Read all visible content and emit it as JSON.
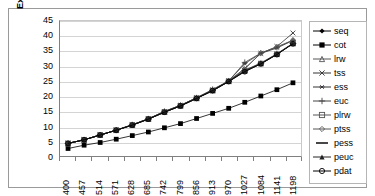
{
  "chart_data": {
    "type": "line",
    "title": "",
    "xlabel": "",
    "ylabel": "Execution Times (secs)",
    "ylim": [
      0,
      45
    ],
    "ytick_step": 5,
    "yticks": [
      45,
      40,
      35,
      30,
      25,
      20,
      15,
      10,
      5,
      0
    ],
    "grid": true,
    "legend_position": "right",
    "categories": [
      400,
      457,
      514,
      571,
      628,
      685,
      742,
      799,
      856,
      913,
      970,
      1027,
      1084,
      1141,
      1198
    ],
    "series": [
      {
        "name": "seq",
        "marker": "filled-diamond",
        "color": "#000000",
        "values": [
          4.2,
          5.4,
          7.0,
          8.6,
          10.3,
          12.3,
          14.6,
          16.7,
          19.2,
          21.7,
          24.8,
          28.2,
          30.7,
          33.9,
          37.5
        ]
      },
      {
        "name": "cot",
        "marker": "filled-square",
        "color": "#000000",
        "values": [
          2.5,
          3.6,
          4.5,
          5.6,
          6.8,
          8.0,
          9.4,
          10.8,
          12.5,
          14.2,
          15.9,
          17.9,
          20.0,
          22.1,
          24.4
        ]
      },
      {
        "name": "lrw",
        "marker": "open-triangle",
        "color": "#555555",
        "values": [
          4.2,
          5.4,
          7.0,
          8.6,
          10.4,
          12.4,
          14.7,
          16.8,
          19.3,
          21.9,
          25.0,
          28.6,
          31.0,
          34.1,
          37.6
        ]
      },
      {
        "name": "tss",
        "marker": "cross-x",
        "color": "#333333",
        "values": [
          4.2,
          5.4,
          7.0,
          8.6,
          10.4,
          12.4,
          14.8,
          16.9,
          19.4,
          22.0,
          25.0,
          29.2,
          34.2,
          36.5,
          41.0
        ]
      },
      {
        "name": "ess",
        "marker": "asterisk",
        "color": "#333333",
        "values": [
          4.2,
          5.4,
          7.0,
          8.6,
          10.4,
          12.4,
          14.8,
          16.9,
          19.4,
          22.0,
          25.0,
          30.8,
          34.2,
          36.0,
          38.5
        ]
      },
      {
        "name": "euc",
        "marker": "plus",
        "color": "#444444",
        "values": [
          4.2,
          5.4,
          7.0,
          8.6,
          10.4,
          12.4,
          14.9,
          16.9,
          19.4,
          22.2,
          25.0,
          31.2,
          34.3,
          36.2,
          38.6
        ]
      },
      {
        "name": "plrw",
        "marker": "open-square",
        "color": "#555555",
        "values": [
          4.2,
          5.4,
          7.0,
          8.6,
          10.3,
          12.3,
          14.6,
          16.7,
          19.2,
          21.8,
          24.9,
          28.4,
          30.8,
          33.9,
          37.5
        ]
      },
      {
        "name": "ptss",
        "marker": "open-diamond",
        "color": "#555555",
        "values": [
          4.2,
          5.4,
          7.0,
          8.6,
          10.4,
          12.4,
          14.7,
          16.8,
          19.3,
          21.9,
          25.0,
          29.0,
          34.3,
          36.4,
          38.6
        ]
      },
      {
        "name": "pess",
        "marker": "dash",
        "color": "#333333",
        "values": [
          4.2,
          5.4,
          7.0,
          8.6,
          10.3,
          12.3,
          14.6,
          16.7,
          19.2,
          21.8,
          24.9,
          28.5,
          30.9,
          34.0,
          37.5
        ]
      },
      {
        "name": "peuc",
        "marker": "filled-triangle",
        "color": "#222222",
        "values": [
          4.2,
          5.4,
          7.0,
          8.6,
          10.3,
          12.3,
          14.6,
          16.7,
          19.2,
          21.8,
          24.9,
          28.3,
          30.8,
          33.9,
          37.5
        ]
      },
      {
        "name": "pdat",
        "marker": "open-circle",
        "color": "#000000",
        "values": [
          4.2,
          5.4,
          7.0,
          8.6,
          10.3,
          12.3,
          14.6,
          16.7,
          19.2,
          21.8,
          24.8,
          28.1,
          30.7,
          33.8,
          37.4
        ]
      }
    ]
  },
  "legend": {
    "items": [
      {
        "label": "seq"
      },
      {
        "label": "cot"
      },
      {
        "label": "lrw"
      },
      {
        "label": "tss"
      },
      {
        "label": "ess"
      },
      {
        "label": "euc"
      },
      {
        "label": "plrw"
      },
      {
        "label": "ptss"
      },
      {
        "label": "pess"
      },
      {
        "label": "peuc"
      },
      {
        "label": "pdat"
      }
    ]
  },
  "colors": {
    "plot_border": "#808080",
    "gridline": "#d4d4d4",
    "frame_border": "#9a9a9a",
    "text": "#000000"
  }
}
